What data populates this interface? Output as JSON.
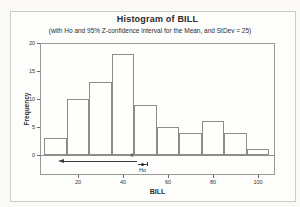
{
  "chart_data": {
    "type": "bar",
    "chart_kind": "histogram",
    "title": "Histogram of BILL",
    "subtitle": "(with Ho and 95% Z-confidence interval for the Mean, and StDev = 25)",
    "xlabel": "BILL",
    "ylabel": "Frequency",
    "bin_centers": [
      10,
      20,
      30,
      40,
      50,
      60,
      70,
      80,
      90,
      100
    ],
    "bin_width": 10,
    "frequencies": [
      3,
      10,
      13,
      18,
      9,
      5,
      4,
      6,
      4,
      1
    ],
    "xticks": [
      20,
      40,
      60,
      80,
      100
    ],
    "yticks": [
      0,
      5,
      10,
      15,
      20
    ],
    "xlim": [
      3,
      107.5
    ],
    "ylim": [
      0,
      20
    ],
    "grid": false,
    "legend": "none",
    "annotation": {
      "xbar_label": "x̄",
      "xbar": 44,
      "upper_bound": 46,
      "arrow_tip": 12,
      "arrow_direction": "left",
      "ho_label": "Ho",
      "ho": 50
    }
  },
  "colors": {
    "figure_background": "#fdfdfb",
    "page_background": "#faf9f6",
    "frame_border": "#9a9a96",
    "bar_fill": "#fefefd",
    "bar_border": "#8c8c88",
    "text": "#2e2e2e",
    "annotation_line": "#3a3a3a",
    "outer_border": "#cbcbc7"
  }
}
